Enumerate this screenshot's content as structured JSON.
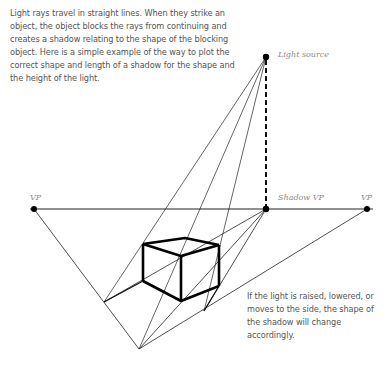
{
  "intro_text": "Light rays travel in straight lines. When they strike an object, the object blocks the rays from continuing and creates a shadow relating to the shape of the blocking object. Here is a simple example of the way to plot the correct shape and length of a shadow for the shape and the height of the light.",
  "note_text": "If the light is raised, lowered, or moves to the side, the shape of the shadow will change accordingly.",
  "labels": {
    "light_source": "Light source",
    "vp_left": "VP",
    "shadow_vp": "Shadow VP",
    "vp_right": "VP"
  },
  "colors": {
    "line": "#111111",
    "text": "#555555",
    "label": "#8a8a8a"
  }
}
